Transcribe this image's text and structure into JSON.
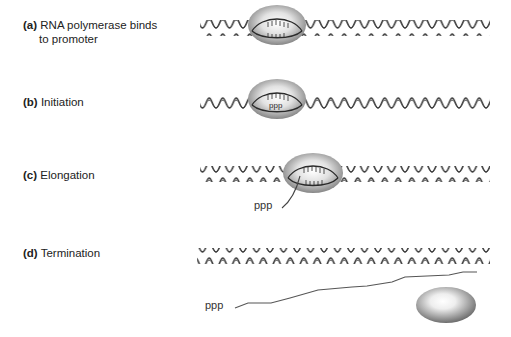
{
  "figure": {
    "stages": [
      {
        "id": "a",
        "tag": "(a)",
        "text_line1": "RNA polymerase binds",
        "text_line2": "to promoter"
      },
      {
        "id": "b",
        "tag": "(b)",
        "text_line1": "Initiation",
        "ppp_in_enzyme": "ppp"
      },
      {
        "id": "c",
        "tag": "(c)",
        "text_line1": "Elongation",
        "ppp_label": "ppp"
      },
      {
        "id": "d",
        "tag": "(d)",
        "text_line1": "Termination",
        "ppp_label": "ppp"
      }
    ],
    "colors": {
      "dna_strand": "#3a3a3a",
      "rna_strand": "#555555",
      "enzyme_light": "#f4f4f4",
      "enzyme_dark": "#7a7a7a"
    }
  }
}
